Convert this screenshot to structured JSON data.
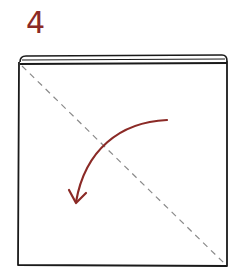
{
  "step": {
    "number": "4"
  },
  "diagram": {
    "type": "origami-fold-instruction",
    "elements": [
      {
        "kind": "square-paper-outline",
        "color": "#1a1a1a"
      },
      {
        "kind": "folded-top-edge",
        "color": "#1a1a1a"
      },
      {
        "kind": "dashed-diagonal-valley-fold",
        "from": "top-left",
        "to": "bottom-right",
        "color": "#8a8a8a"
      },
      {
        "kind": "curved-fold-arrow",
        "direction": "top-right-to-bottom-left",
        "color": "#8b2a26"
      }
    ]
  },
  "colors": {
    "accent": "#8b2a26",
    "outline": "#1a1a1a",
    "fold_line": "#8a8a8a"
  }
}
